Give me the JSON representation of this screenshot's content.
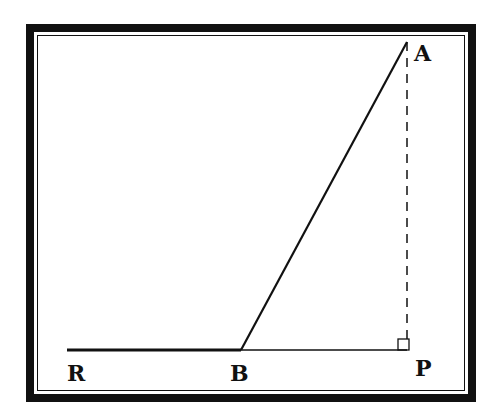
{
  "diagram": {
    "type": "geometry-figure",
    "labels": {
      "A": "A",
      "B": "B",
      "P": "P",
      "R": "R"
    },
    "points": {
      "A": [
        407,
        42
      ],
      "B": [
        241,
        350
      ],
      "P": [
        407,
        350
      ],
      "R": [
        67,
        350
      ]
    },
    "segments": [
      {
        "from": "R",
        "to": "B",
        "style": "thick"
      },
      {
        "from": "B",
        "to": "P",
        "style": "thin"
      },
      {
        "from": "B",
        "to": "A",
        "style": "solid"
      },
      {
        "from": "A",
        "to": "P",
        "style": "dashed"
      }
    ],
    "right_angle_at": "P"
  }
}
